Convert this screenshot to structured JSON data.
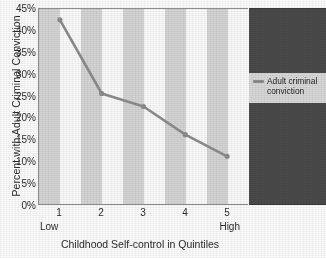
{
  "chart_data": {
    "type": "line",
    "title": "",
    "xlabel": "Childhood Self-control in Quintiles",
    "ylabel": "Percent with Adult Criminal Conviction",
    "categories": [
      "1",
      "2",
      "3",
      "4",
      "5"
    ],
    "category_end_labels": {
      "low": "Low",
      "high": "High"
    },
    "series": [
      {
        "name": "Adult criminal conviction",
        "values": [
          42.5,
          25.5,
          22.5,
          16.0,
          11.0
        ],
        "color": "#8d8d8d",
        "marker": "circle"
      }
    ],
    "ylim": [
      0,
      45
    ],
    "yticks": [
      0,
      5,
      10,
      15,
      20,
      25,
      30,
      35,
      40,
      45
    ],
    "ytick_labels": [
      "0%",
      "5%",
      "10%",
      "15%",
      "20%",
      "25%",
      "30%",
      "35%",
      "40%",
      "45%"
    ],
    "grid": false,
    "plot_banding": "alternating vertical gray and white bands, one per quintile half-step",
    "legend": {
      "position": "right-panel",
      "panel_color": "#4a4a4a",
      "entries": [
        {
          "label_line1": "Adult criminal",
          "label_line2": "conviction",
          "full_label": "Adult criminal conviction",
          "swatch_color": "#8d8d8d"
        }
      ]
    }
  },
  "axes": {
    "y_title": "Percent with Adult Criminal Conviction",
    "x_title": "Childhood Self-control in Quintiles"
  }
}
